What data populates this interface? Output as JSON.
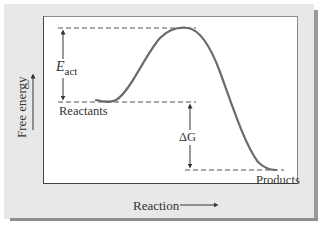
{
  "diagram": {
    "title": "",
    "type": "reaction energy profile",
    "x_axis": {
      "label": "Reaction",
      "arrow": "right-arrow"
    },
    "y_axis": {
      "label": "Free energy",
      "arrow": "up-arrow"
    },
    "labels": {
      "reactants": "Reactants",
      "products": "Products",
      "activation_energy": {
        "symbol": "E",
        "subscript": "act"
      },
      "free_energy_change": "ΔG"
    },
    "levels": {
      "transition_state": "highest",
      "reactants": "intermediate",
      "products": "lowest"
    },
    "colors": {
      "curve": "#6b6b6b",
      "frame": "#e8e8e8",
      "frame_shadow": "#9a9a9a",
      "plot_background": "#ffffff",
      "text": "#333333",
      "dashed_lines": "#555555"
    }
  }
}
